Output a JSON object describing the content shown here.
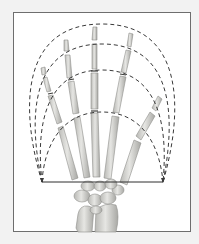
{
  "figure": {
    "background_color": "#f2f2f2",
    "frame_color": "#6e6e6e",
    "bone_color": "#d9d9d6",
    "bone_shade": "#a9a9a5",
    "arc_color": "#3a3a3a",
    "baseline": {
      "x1": 42,
      "x2": 163,
      "y": 182
    },
    "arcs": [
      {
        "name": "outer-arc",
        "peak_y": 24
      },
      {
        "name": "second-arc",
        "peak_y": 44
      },
      {
        "name": "third-arc",
        "peak_y": 70
      },
      {
        "name": "inner-arc",
        "peak_y": 112
      }
    ],
    "digits": [
      "little finger",
      "ring finger",
      "middle finger",
      "index finger",
      "thumb"
    ]
  }
}
